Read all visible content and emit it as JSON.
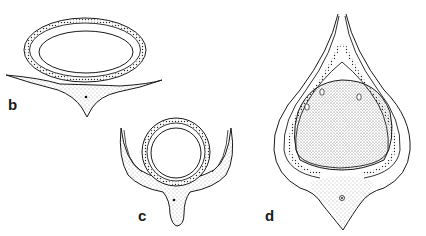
{
  "figure": {
    "panels": [
      {
        "id": "b",
        "label": "b",
        "description": "Transverse section: oval ovule seated on a flat stippled wing-like base with pointed keel"
      },
      {
        "id": "c",
        "label": "c",
        "description": "Transverse section: round ovule in cup with upturned lateral wings and stippled stalk"
      },
      {
        "id": "d",
        "label": "d",
        "description": "Transverse section: large stippled nucellus enclosed by layered integuments converging to a beaked apex, stippled base with central dot"
      }
    ],
    "colors": {
      "ink": "#1a1a1a",
      "stipple": "#6b6b6b",
      "background": "#ffffff"
    }
  }
}
